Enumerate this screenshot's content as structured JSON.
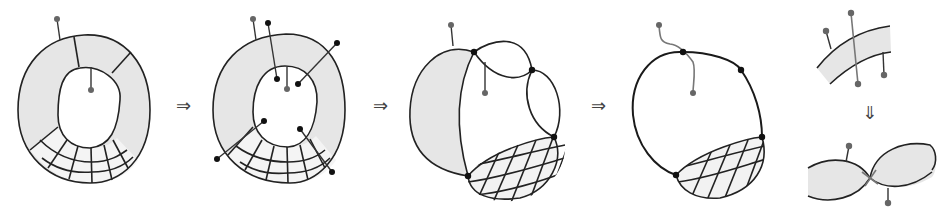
{
  "figure": {
    "arrows": [
      {
        "id": "arrow-1",
        "glyph": "⇒",
        "x": 176,
        "y": 97
      },
      {
        "id": "arrow-2",
        "glyph": "⇒",
        "x": 373,
        "y": 97
      },
      {
        "id": "arrow-3",
        "glyph": "⇒",
        "x": 591,
        "y": 97
      },
      {
        "id": "arrow-4",
        "glyph": "⇓",
        "x": 862,
        "y": 104
      }
    ],
    "panels": [
      {
        "id": "panel-1",
        "label": "annulus with radial segments and hatched grid region, two gray pins"
      },
      {
        "id": "panel-2",
        "label": "annulus with additional black pins crossing the band"
      },
      {
        "id": "panel-3",
        "label": "pinched shaded lobes joined at black nodes with cross-hatched lobe"
      },
      {
        "id": "panel-4",
        "label": "single closed loop with nodes, wavy gray pin and cross-hatched lobe"
      },
      {
        "id": "panel-5",
        "label": "local detail: band crossed by pins, transformed into two tangent lobes"
      }
    ],
    "colors": {
      "shade": "#e6e6e6",
      "stroke": "#222222",
      "pin_gray": "#666666",
      "pin_black": "#111111",
      "background": "#ffffff"
    }
  }
}
